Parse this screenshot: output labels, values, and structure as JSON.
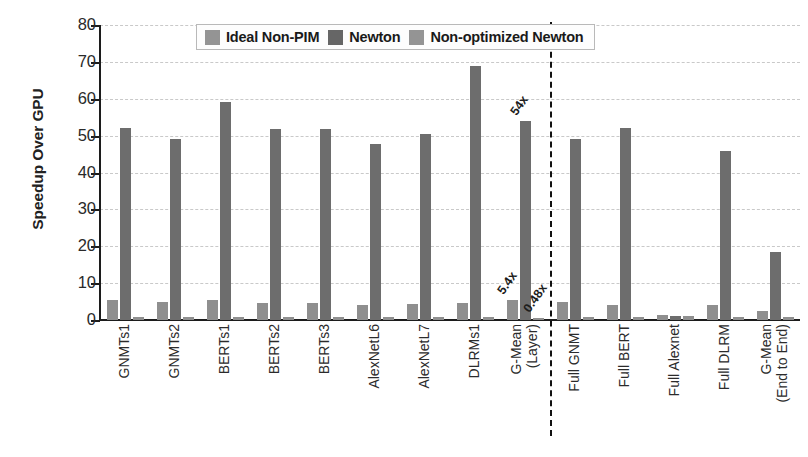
{
  "chart_data": {
    "type": "bar",
    "title": "",
    "xlabel": "",
    "ylabel": "Speedup Over GPU",
    "ylim": [
      0,
      80
    ],
    "yticks": [
      0,
      10,
      20,
      30,
      40,
      50,
      60,
      70,
      80
    ],
    "grid": true,
    "legend_position": "top-center",
    "categories": [
      "GNMTs1",
      "GNMTs2",
      "BERTs1",
      "BERTs2",
      "BERTs3",
      "AlexNetL6",
      "AlexNetL7",
      "DLRMs1",
      "G-Mean (Layer)",
      "Full GNMT",
      "Full BERT",
      "Full Alexnet",
      "Full DLRM",
      "G-Mean (End to End)"
    ],
    "series": [
      {
        "name": "Ideal Non-PIM",
        "color": "#8f8f8f",
        "values": [
          5.3,
          4.8,
          5.5,
          4.7,
          4.5,
          4.1,
          4.4,
          4.6,
          5.4,
          4.8,
          4.2,
          1.3,
          4.2,
          2.4
        ]
      },
      {
        "name": "Newton",
        "color": "#6d6d6d",
        "values": [
          52.0,
          49.0,
          59.0,
          51.7,
          51.7,
          47.6,
          50.4,
          68.8,
          54.0,
          49.2,
          52.0,
          1.2,
          45.7,
          18.5
        ]
      },
      {
        "name": "Non-optimized Newton",
        "color": "#8f8f8f",
        "values": [
          0.9,
          0.8,
          0.9,
          0.8,
          0.8,
          0.7,
          0.8,
          0.9,
          0.48,
          0.9,
          0.8,
          1.1,
          0.8,
          0.7
        ]
      }
    ],
    "annotations": [
      {
        "text": "5.4x",
        "category": "G-Mean (Layer)",
        "series": "Ideal Non-PIM",
        "rotation": -55
      },
      {
        "text": "54x",
        "category": "G-Mean (Layer)",
        "series": "Newton",
        "rotation": -55
      },
      {
        "text": "0.48x",
        "category": "G-Mean (Layer)",
        "series": "Non-optimized Newton",
        "rotation": -55
      }
    ],
    "divider": {
      "after_category": "G-Mean (Layer)",
      "style": "dashed",
      "color": "#111111"
    }
  },
  "xtick_labels": [
    {
      "line1": "GNMTs1",
      "line2": ""
    },
    {
      "line1": "GNMTs2",
      "line2": ""
    },
    {
      "line1": "BERTs1",
      "line2": ""
    },
    {
      "line1": "BERTs2",
      "line2": ""
    },
    {
      "line1": "BERTs3",
      "line2": ""
    },
    {
      "line1": "AlexNetL6",
      "line2": ""
    },
    {
      "line1": "AlexNetL7",
      "line2": ""
    },
    {
      "line1": "DLRMs1",
      "line2": ""
    },
    {
      "line1": "G-Mean",
      "line2": "(Layer)"
    },
    {
      "line1": "Full GNMT",
      "line2": ""
    },
    {
      "line1": "Full BERT",
      "line2": ""
    },
    {
      "line1": "Full Alexnet",
      "line2": ""
    },
    {
      "line1": "Full DLRM",
      "line2": ""
    },
    {
      "line1": "G-Mean",
      "line2": "(End to End)"
    }
  ],
  "legend": {
    "items": [
      {
        "label": "Ideal Non-PIM",
        "color": "#949494"
      },
      {
        "label": "Newton",
        "color": "#666666"
      },
      {
        "label": "Non-optimized Newton",
        "color": "#949494"
      }
    ]
  },
  "axis": {
    "y_title": "Speedup Over GPU",
    "y_tick_labels": [
      "80",
      "70",
      "60",
      "50",
      "40",
      "30",
      "20",
      "10",
      "0"
    ]
  }
}
